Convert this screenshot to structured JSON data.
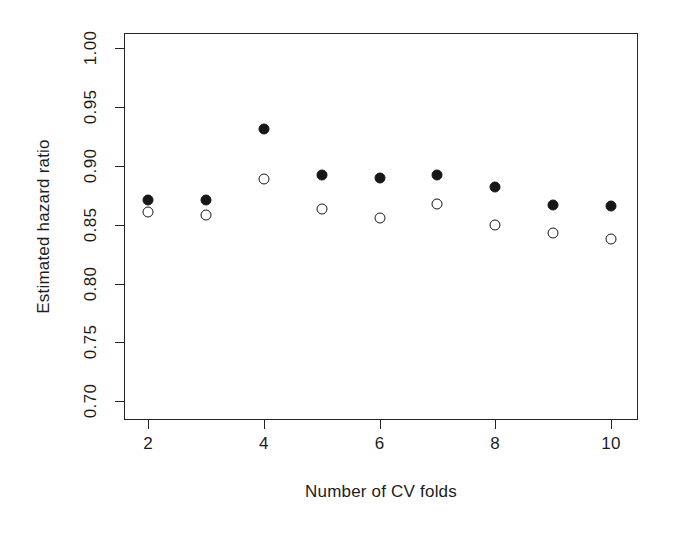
{
  "chart_data": {
    "type": "scatter",
    "title": "",
    "xlabel": "Number of CV folds",
    "ylabel": "Estimated hazard ratio",
    "x": [
      2,
      3,
      4,
      5,
      6,
      7,
      8,
      9,
      10
    ],
    "xlim": [
      1.6,
      10.45
    ],
    "ylim": [
      0.685,
      1.012
    ],
    "xticks": [
      2,
      4,
      6,
      8,
      10
    ],
    "xtick_labels": [
      "2",
      "4",
      "6",
      "8",
      "10"
    ],
    "yticks": [
      0.7,
      0.75,
      0.8,
      0.85,
      0.9,
      0.95,
      1.0
    ],
    "ytick_labels": [
      "0.70",
      "0.75",
      "0.80",
      "0.85",
      "0.90",
      "0.95",
      "1.00"
    ],
    "grid": false,
    "legend": false,
    "legend_position": "none",
    "series": [
      {
        "name": "filled",
        "marker": "filled-circle",
        "color": "#171717",
        "values": [
          0.871,
          0.871,
          0.931,
          0.892,
          0.89,
          0.892,
          0.882,
          0.867,
          0.866
        ]
      },
      {
        "name": "open",
        "marker": "open-circle",
        "color": "#171717",
        "values": [
          0.861,
          0.858,
          0.889,
          0.863,
          0.856,
          0.868,
          0.85,
          0.843,
          0.838
        ]
      }
    ]
  }
}
